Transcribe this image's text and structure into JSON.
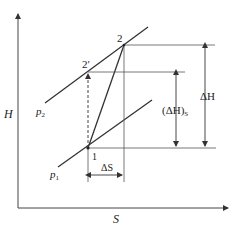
{
  "diagram": {
    "type": "H-S diagram (enthalpy-entropy)",
    "axes": {
      "x_label": "S",
      "y_label": "H"
    },
    "isobars": [
      {
        "id": "p1",
        "label": "p",
        "subscript": "1"
      },
      {
        "id": "p2",
        "label": "p",
        "subscript": "2"
      }
    ],
    "points": [
      {
        "id": "1",
        "label": "1"
      },
      {
        "id": "2",
        "label": "2"
      },
      {
        "id": "2prime",
        "label": "2′"
      }
    ],
    "dimensions": {
      "delta_H": "ΔH",
      "delta_H_s": "(ΔH)",
      "delta_H_s_sub": "S",
      "delta_S": "ΔS"
    },
    "colors": {
      "line": "#333333",
      "thin_line": "#555555",
      "background": "#ffffff"
    }
  }
}
